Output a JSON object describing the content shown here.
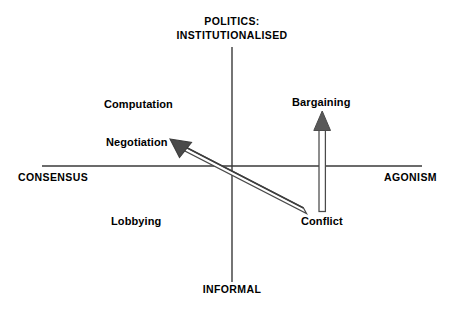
{
  "diagram": {
    "title_vertical_top": "POLITICS:",
    "title_vertical_top_line2": "INSTITUTIONALISED",
    "axis_bottom": "INFORMAL",
    "axis_left": "CONSENSUS",
    "axis_right": "AGONISM",
    "quadrant_labels": [
      {
        "id": "computation",
        "text": "Computation"
      },
      {
        "id": "negotiation",
        "text": "Negotiation"
      },
      {
        "id": "lobbying",
        "text": "Lobbying"
      },
      {
        "id": "bargaining",
        "text": "Bargaining"
      },
      {
        "id": "conflict",
        "text": "Conflict"
      }
    ],
    "arrows": [
      {
        "id": "conflict-to-negotiation",
        "from": "Conflict",
        "to": "Negotiation",
        "direction": "up-left",
        "style": "outlined-3d"
      },
      {
        "id": "conflict-to-bargaining",
        "from": "Conflict",
        "to": "Bargaining",
        "direction": "up",
        "style": "outlined-3d"
      }
    ],
    "colors": {
      "axis": "#3a3a3a",
      "text": "#000000",
      "arrow_fill": "#ffffff",
      "arrow_outline": "#4a4a4a",
      "arrowhead_fill": "#595959",
      "arrowhead_dark": "#3d3d3d",
      "background": "#ffffff"
    }
  }
}
